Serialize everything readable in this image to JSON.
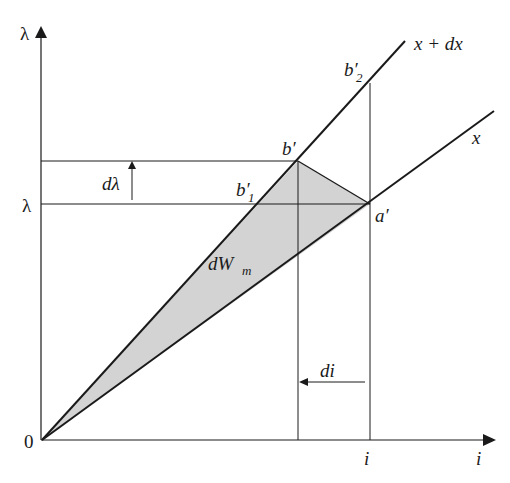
{
  "figure": {
    "type": "lambda-i characteristic diagram",
    "axes": {
      "y_axis_label": "λ",
      "x_axis_label": "i",
      "origin_label": "0"
    },
    "levels": {
      "lambda_label": "λ",
      "dlambda_label": "dλ",
      "i_label": "i",
      "di_label": "di"
    },
    "curves": {
      "upper_label": "x + dx",
      "lower_label": "x"
    },
    "points": {
      "b_prime": "b′",
      "a_prime": "a′",
      "b1_prime_base": "b′",
      "b1_prime_sub": "1",
      "b2_prime_base": "b′",
      "b2_prime_sub": "2"
    },
    "region": {
      "label_base": "dW",
      "label_sub": "m",
      "fill_color": "#d3d3d3"
    },
    "colors": {
      "line": "#1a1a1a",
      "background": "#ffffff"
    }
  }
}
